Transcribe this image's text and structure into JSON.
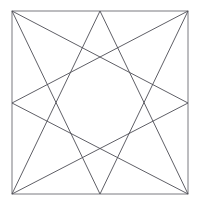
{
  "figure": {
    "background_color": "#ffffff",
    "frame": {
      "name": "square-outline",
      "stroke_color": "#7a7a80",
      "stroke_width": 1,
      "left": 12,
      "top": 11,
      "right": 188,
      "bottom": 194
    },
    "star": {
      "name": "octagram",
      "schlafli": "{8/3}",
      "point_count": 8,
      "step": 3,
      "stroke_color": "#4d4d55",
      "stroke_width": 0.9,
      "vertices": [
        {
          "name": "top-left-corner",
          "x": 12,
          "y": 11
        },
        {
          "name": "top-midpoint",
          "x": 100,
          "y": 11
        },
        {
          "name": "top-right-corner",
          "x": 188,
          "y": 11
        },
        {
          "name": "right-midpoint",
          "x": 188,
          "y": 103
        },
        {
          "name": "bottom-right-corner",
          "x": 188,
          "y": 194
        },
        {
          "name": "bottom-midpoint",
          "x": 100,
          "y": 194
        },
        {
          "name": "bottom-left-corner",
          "x": 12,
          "y": 194
        },
        {
          "name": "left-midpoint",
          "x": 12,
          "y": 103
        }
      ],
      "edges": [
        [
          0,
          3
        ],
        [
          3,
          6
        ],
        [
          6,
          1
        ],
        [
          1,
          4
        ],
        [
          4,
          7
        ],
        [
          7,
          2
        ],
        [
          2,
          5
        ],
        [
          5,
          0
        ]
      ]
    }
  }
}
